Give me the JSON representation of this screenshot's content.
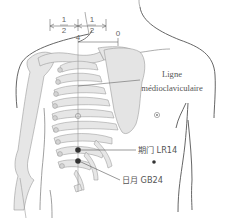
{
  "figure": {
    "measurement": {
      "left_fraction_numerator": "1",
      "left_fraction_denominator": "2",
      "right_fraction_numerator": "1",
      "right_fraction_denominator": "2",
      "scale_mark_left": "4",
      "scale_mark_right": "0"
    },
    "labels": {
      "line_label_1": "Ligne",
      "line_label_2": "médioclaviculaire",
      "point_lr14": "期门 LR14",
      "point_gb24": "日月 GB24"
    },
    "colors": {
      "bone_fill": "#e4e4e4",
      "bone_stroke": "#9a9a9a",
      "outline": "#555555",
      "point": "#333333",
      "text": "#555555"
    }
  }
}
